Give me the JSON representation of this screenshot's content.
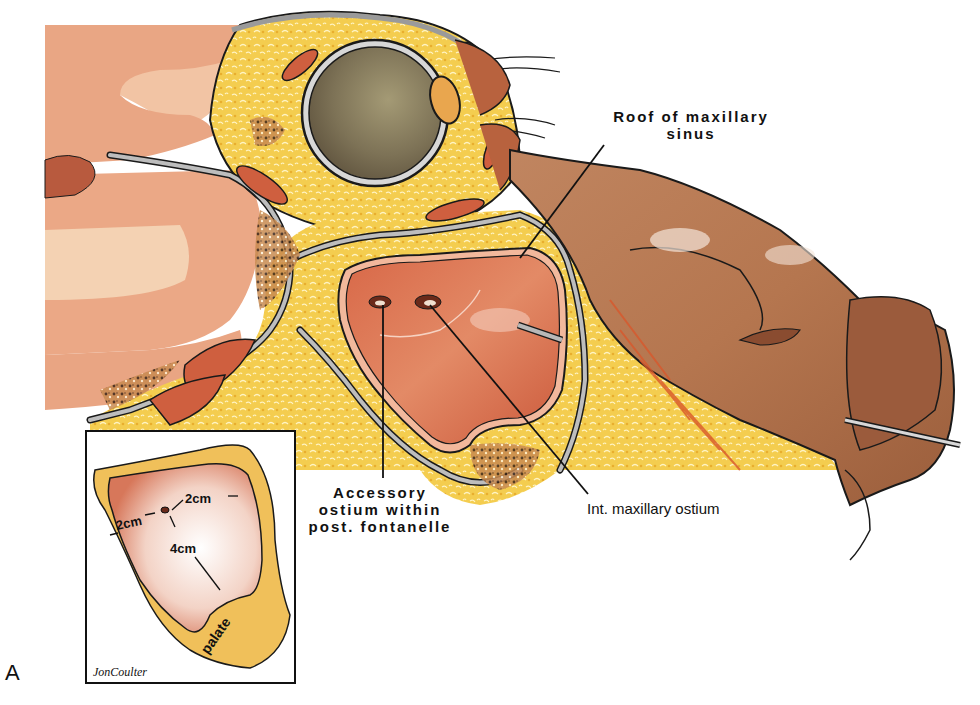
{
  "figure": {
    "letter": "A"
  },
  "labels": {
    "roof": [
      "Roof of maxillary",
      "sinus"
    ],
    "accessory": [
      "Accessory",
      "ostium within",
      "post. fontanelle"
    ],
    "int_ostium": "Int. maxillary ostium"
  },
  "inset": {
    "measure_top": "2cm",
    "measure_left": "2cm",
    "measure_depth": "4cm",
    "palate": "palate",
    "signature": "JonCoulter"
  },
  "colors": {
    "fat_yellow": "#f2c94a",
    "sinus_mucosa": "#d9694a",
    "nose_skin": "#b77a56",
    "brain_pink": "#eeb08f",
    "eye": "#7c7258",
    "bone_gray": "#b8b8b8",
    "outline": "#1a1a1a"
  }
}
